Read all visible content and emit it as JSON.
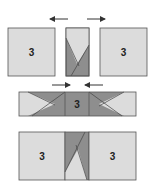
{
  "diagram": {
    "colors": {
      "light": "#dcdcdc",
      "dark": "#8e8e8e",
      "stroke": "#555555",
      "arrow": "#333333"
    },
    "row1": {
      "left_label": "3",
      "right_label": "3"
    },
    "row2": {
      "center_label": "3"
    },
    "row3": {
      "left_label": "3",
      "right_label": "3"
    }
  }
}
